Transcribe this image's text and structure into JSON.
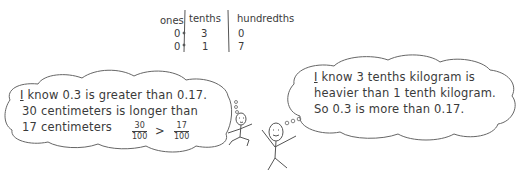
{
  "place_value_table": {
    "headers": [
      "ones",
      "tenths",
      "hundredths"
    ],
    "rows": [
      {
        "ones": "0",
        "tenths": "3",
        "hundredths": "0"
      },
      {
        "ones": "0",
        "tenths": "1",
        "hundredths": "7"
      }
    ]
  },
  "left_bubble": {
    "line1_first": "I",
    "line1_rest": " know 0.3 is greater than 0.17.",
    "line2": "30 centimeters is longer than",
    "line3": "17 centimeters",
    "fraction_left": {
      "numerator": "30",
      "denominator": "100"
    },
    "comparison": ">",
    "fraction_right": {
      "numerator": "17",
      "denominator": "100"
    }
  },
  "right_bubble": {
    "line1_first": "I",
    "line1_rest": " know 3 tenths kilogram is",
    "line2": "heavier than 1 tenth kilogram.",
    "line3": "So 0.3 is more than 0.17."
  }
}
